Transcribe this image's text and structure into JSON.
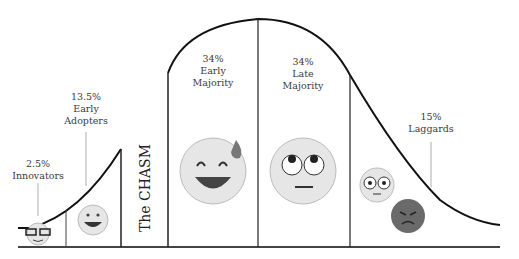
{
  "segments": [
    {
      "name": "innovators",
      "pct": "2.5%",
      "label": "Innovators",
      "emoji": "nerd-face"
    },
    {
      "name": "early-adopters",
      "pct": "13.5%",
      "label1": "Early",
      "label2": "Adopters",
      "emoji": "grinning-face"
    },
    {
      "name": "early-majority",
      "pct": "34%",
      "label1": "Early",
      "label2": "Majority",
      "emoji": "grinning-sweat-face"
    },
    {
      "name": "late-majority",
      "pct": "34%",
      "label1": "Late",
      "label2": "Majority",
      "emoji": "eye-roll-face"
    },
    {
      "name": "laggards",
      "pct": "15%",
      "label": "Laggards",
      "emoji": "flushed-and-angry-faces"
    }
  ],
  "chasm_label": "The CHASM",
  "colors": {
    "line": "#111111",
    "divider": "#333333",
    "text": "#3a3a3a",
    "face": "#e4e4e4",
    "angry": "#6a6a6a"
  }
}
